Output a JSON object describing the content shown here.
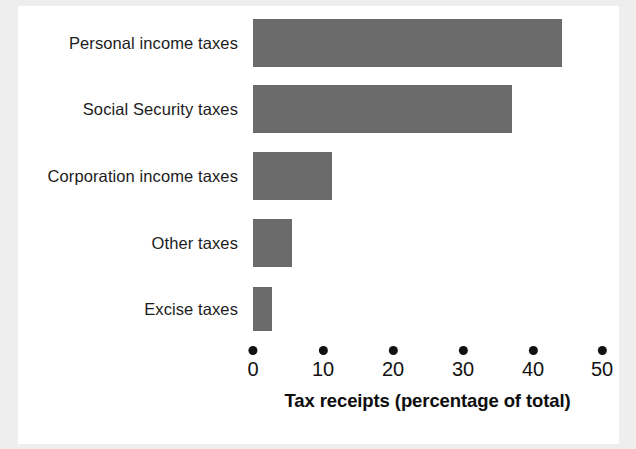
{
  "chart_data": {
    "type": "bar",
    "orientation": "horizontal",
    "title": "",
    "xlabel": "Tax receipts (percentage of total)",
    "ylabel": "",
    "categories": [
      "Personal income taxes",
      "Social Security taxes",
      "Corporation income taxes",
      "Other taxes",
      "Excise taxes"
    ],
    "values": [
      44.3,
      37.1,
      11.3,
      5.6,
      2.7
    ],
    "xlim": [
      0,
      50
    ],
    "xticks": [
      0,
      10,
      20,
      30,
      40,
      50
    ],
    "xticklabels": [
      "0",
      "10",
      "20",
      "30",
      "40",
      "50"
    ],
    "grid": false,
    "legend": false,
    "bar_color": "#6b6b6b",
    "text_color": "#111111",
    "background_color": "#ffffff"
  },
  "axis": {
    "title": "Tax receipts (percentage of total)"
  }
}
